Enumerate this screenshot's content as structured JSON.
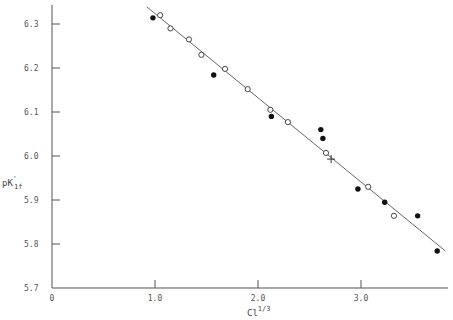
{
  "chart_data": {
    "type": "scatter",
    "title": "",
    "xlabel": "Cl^1/3",
    "xlabel_base": "Cl",
    "xlabel_sup": "1/3",
    "ylabel": "pK'1f",
    "ylabel_base": "pK",
    "ylabel_sup": "'",
    "ylabel_sub": "1f",
    "xlim": [
      0,
      3.9
    ],
    "ylim": [
      5.7,
      6.34
    ],
    "xticks": [
      0,
      1.0,
      2.0,
      3.0
    ],
    "xtick_labels": [
      "0",
      "1.0",
      "2.0",
      "3.0"
    ],
    "yticks": [
      5.7,
      5.8,
      5.9,
      6.0,
      6.1,
      6.2,
      6.3
    ],
    "ytick_labels": [
      "5.7",
      "5.8",
      "5.9",
      "6.0",
      "6.1",
      "6.2",
      "6.3"
    ],
    "grid": false,
    "legend": null,
    "series": [
      {
        "name": "open circles",
        "marker": "open-circle",
        "x": [
          1.05,
          1.15,
          1.33,
          1.45,
          1.68,
          1.9,
          2.12,
          2.29,
          2.66,
          3.07,
          3.32
        ],
        "y": [
          6.32,
          6.29,
          6.265,
          6.23,
          6.198,
          6.152,
          6.105,
          6.077,
          6.007,
          5.93,
          5.864
        ]
      },
      {
        "name": "filled circles",
        "marker": "filled-circle",
        "x": [
          0.98,
          1.57,
          2.13,
          2.61,
          2.63,
          2.97,
          3.23,
          3.55,
          3.74
        ],
        "y": [
          6.314,
          6.184,
          6.09,
          6.06,
          6.04,
          5.925,
          5.895,
          5.864,
          5.784
        ]
      },
      {
        "name": "cross",
        "marker": "cross",
        "x": [
          2.71
        ],
        "y": [
          5.993
        ]
      },
      {
        "name": "fit line",
        "type": "line",
        "x": [
          0.92,
          3.82
        ],
        "y": [
          6.339,
          5.784
        ]
      }
    ]
  }
}
